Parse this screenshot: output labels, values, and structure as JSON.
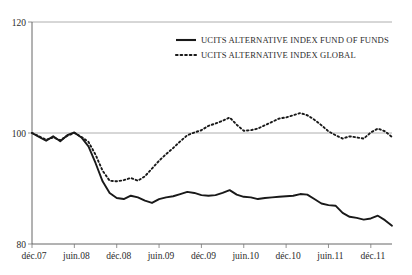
{
  "chart_data": {
    "type": "line",
    "title": "",
    "subtitle": "",
    "xlabel": "",
    "ylabel": "",
    "ylim": [
      80,
      120
    ],
    "yticks": [
      80,
      100,
      120
    ],
    "ytick_labels": [
      "80",
      "100",
      "120"
    ],
    "grid": true,
    "grid_axis": "y",
    "legend_position": "top-center",
    "xtick_labels": [
      "déc.07",
      "juin.08",
      "déc.08",
      "juin.09",
      "déc.09",
      "juin.10",
      "déc.10",
      "juin.11",
      "déc.11"
    ],
    "x_period_start": "déc.07",
    "x_period_end": "déc.11",
    "x_frequency": "monthly",
    "x": [
      "déc.07",
      "janv.08",
      "févr.08",
      "mars.08",
      "avr.08",
      "mai.08",
      "juin.08",
      "juil.08",
      "août.08",
      "sept.08",
      "oct.08",
      "nov.08",
      "déc.08",
      "janv.09",
      "févr.09",
      "mars.09",
      "avr.09",
      "mai.09",
      "juin.09",
      "juil.09",
      "août.09",
      "sept.09",
      "oct.09",
      "nov.09",
      "déc.09",
      "janv.10",
      "févr.10",
      "mars.10",
      "avr.10",
      "mai.10",
      "juin.10",
      "juil.10",
      "août.10",
      "sept.10",
      "oct.10",
      "nov.10",
      "déc.10",
      "janv.11",
      "févr.11",
      "mars.11",
      "avr.11",
      "mai.11",
      "juin.11",
      "juil.11",
      "août.11",
      "sept.11",
      "oct.11",
      "nov.11",
      "déc.11",
      "janv.12",
      "févr.12",
      "mars.12"
    ],
    "series": [
      {
        "name": "UCITS ALTERNATIVE INDEX FUND OF FUNDS",
        "style": "solid",
        "color": "#191919",
        "values": [
          100.0,
          99.3,
          98.6,
          99.4,
          98.5,
          99.6,
          100.1,
          99.2,
          97.6,
          94.6,
          91.3,
          89.2,
          88.3,
          88.1,
          88.7,
          88.4,
          87.8,
          87.4,
          88.1,
          88.4,
          88.6,
          89.0,
          89.4,
          89.2,
          88.8,
          88.7,
          88.8,
          89.2,
          89.7,
          88.9,
          88.5,
          88.4,
          88.1,
          88.3,
          88.4,
          88.5,
          88.6,
          88.7,
          89.0,
          88.9,
          88.1,
          87.3,
          87.0,
          86.9,
          85.6,
          84.9,
          84.7,
          84.4,
          84.6,
          85.1,
          84.3,
          83.3
        ]
      },
      {
        "name": "UCITS ALTERNATIVE INDEX GLOBAL",
        "style": "dotted",
        "color": "#191919",
        "values": [
          100.0,
          99.4,
          98.8,
          99.2,
          98.7,
          99.5,
          100.0,
          99.3,
          98.4,
          96.1,
          93.2,
          91.4,
          91.3,
          91.5,
          91.9,
          91.4,
          92.2,
          93.6,
          95.0,
          96.2,
          97.3,
          98.5,
          99.6,
          100.1,
          100.5,
          101.3,
          101.7,
          102.2,
          102.8,
          101.5,
          100.4,
          100.5,
          100.8,
          101.4,
          102.0,
          102.6,
          102.8,
          103.2,
          103.6,
          103.2,
          102.4,
          101.4,
          100.3,
          99.6,
          99.0,
          99.4,
          99.2,
          99.0,
          100.1,
          100.8,
          100.3,
          99.3
        ]
      }
    ],
    "legend": [
      {
        "label": "UCITS ALTERNATIVE INDEX FUND OF FUNDS",
        "style": "solid"
      },
      {
        "label": "UCITS ALTERNATIVE INDEX GLOBAL",
        "style": "dotted"
      }
    ]
  }
}
